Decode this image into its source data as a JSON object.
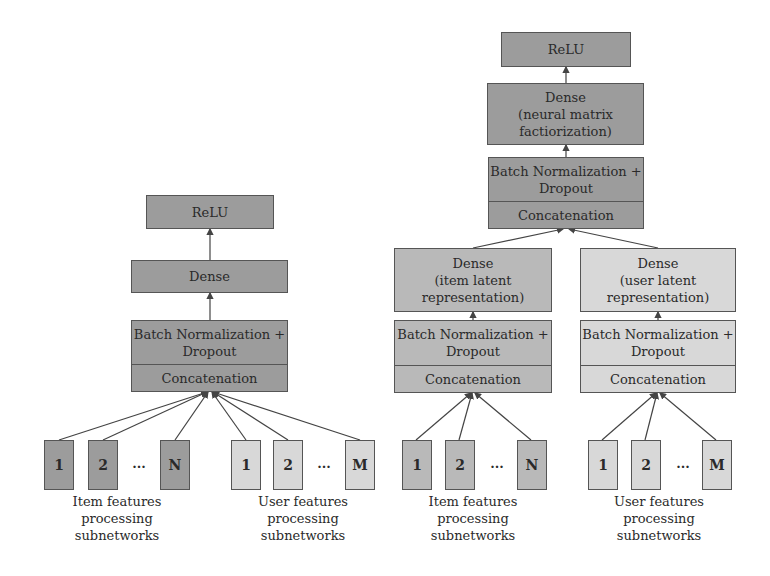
{
  "diagram": {
    "title": "",
    "colors": {
      "top_layers": "#9c9c9c",
      "item_branch": "#b9b9b9",
      "user_branch": "#d8d8d8",
      "border": "#555555",
      "arrow": "#444444"
    },
    "left_model": {
      "relu": "ReLU",
      "dense": "Dense",
      "bn_dropout": "Batch Normalization +\nDropout",
      "concat": "Concatenation",
      "item_inputs": [
        "1",
        "2",
        "N"
      ],
      "user_inputs": [
        "1",
        "2",
        "M"
      ],
      "ellipsis": "...",
      "item_caption": "Item features\nprocessing\nsubnetworks",
      "user_caption": "User features\nprocessing\nsubnetworks"
    },
    "right_model": {
      "relu": "ReLU",
      "dense": "Dense\n(neural matrix\nfactiorization)",
      "bn_dropout": "Batch Normalization +\nDropout",
      "concat": "Concatenation",
      "item_branch": {
        "dense": "Dense\n(item latent\nrepresentation)",
        "bn_dropout": "Batch Normalization +\nDropout",
        "concat": "Concatenation",
        "inputs": [
          "1",
          "2",
          "N"
        ],
        "ellipsis": "...",
        "caption": "Item features\nprocessing\nsubnetworks"
      },
      "user_branch": {
        "dense": "Dense\n(user latent\nrepresentation)",
        "bn_dropout": "Batch Normalization +\nDropout",
        "concat": "Concatenation",
        "inputs": [
          "1",
          "2",
          "M"
        ],
        "ellipsis": "...",
        "caption": "User features\nprocessing\nsubnetworks"
      }
    }
  }
}
